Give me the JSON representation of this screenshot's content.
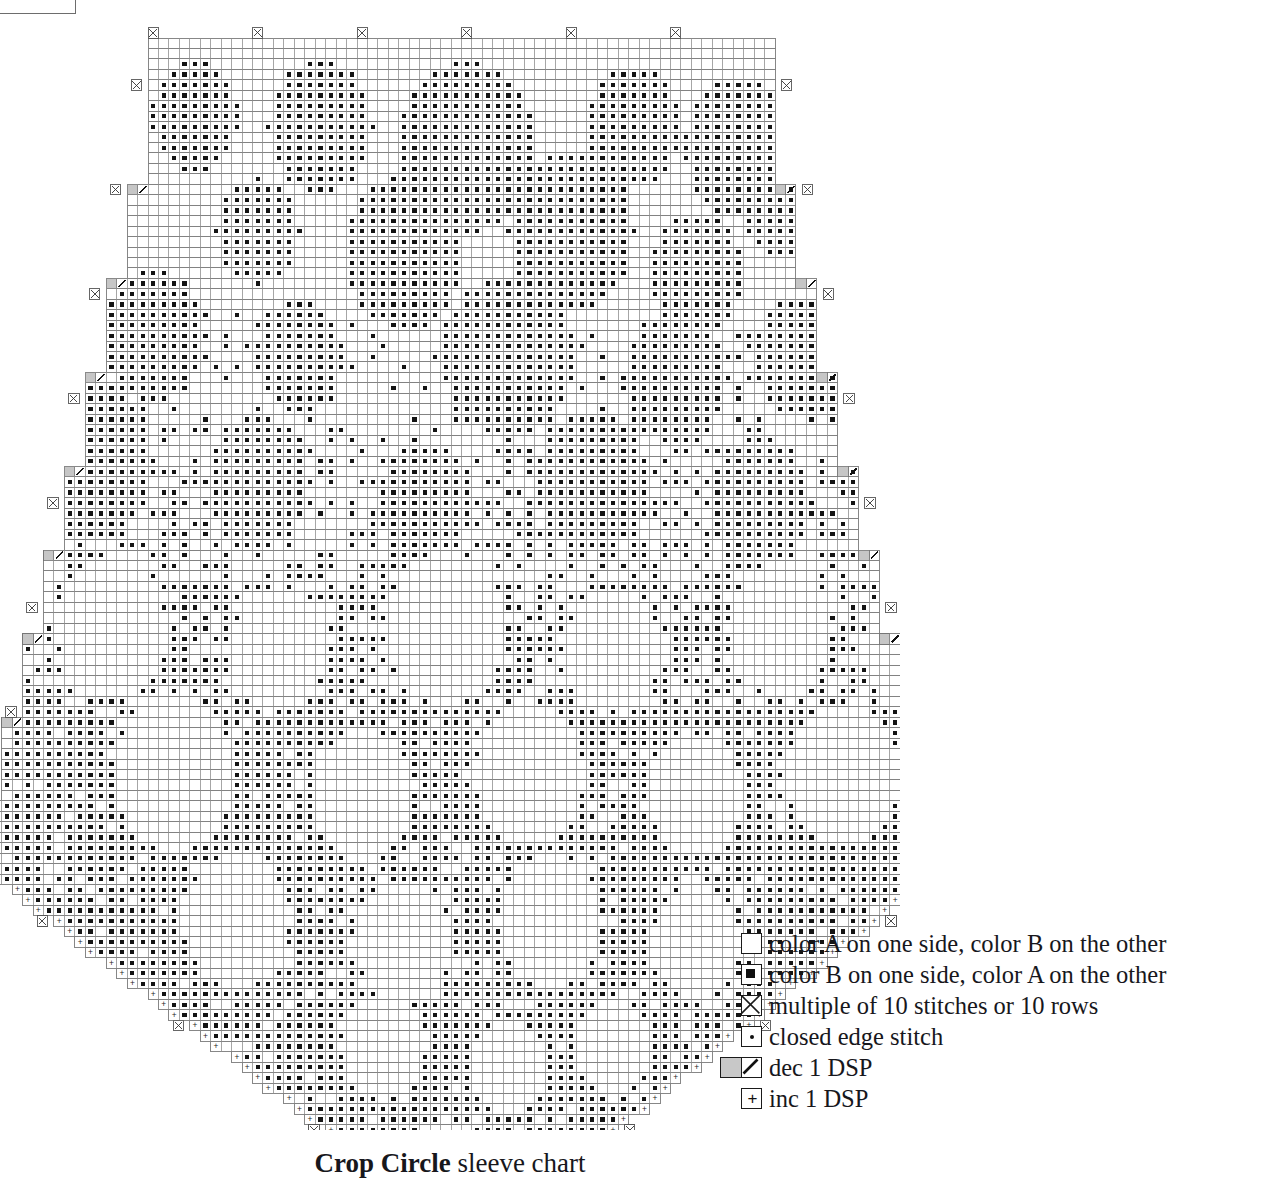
{
  "caption": {
    "name": "Crop Circle",
    "rest": " sleeve chart"
  },
  "artifact": {
    "text": "—y—"
  },
  "legend": {
    "title": "key",
    "items": [
      {
        "symbol": "empty-square",
        "label": "color A on one side, color B on the other"
      },
      {
        "symbol": "filled-square",
        "label": "color B on one side, color A on the other"
      },
      {
        "symbol": "crossed-square",
        "label": "multiple of 10 stitches or 10 rows"
      },
      {
        "symbol": "dotted-square",
        "label": "closed edge stitch"
      },
      {
        "symbol": "dec-pair",
        "label": "dec 1 DSP"
      },
      {
        "symbol": "plus-square",
        "label": "inc 1 DSP"
      }
    ]
  },
  "chart_data": {
    "type": "grid-chart",
    "title": "Crop Circle sleeve chart",
    "cell_px": 10.45,
    "origin": {
      "x": 148.0,
      "y": 38.0
    },
    "colors": {
      "grid_line": "#6f6f6f",
      "grid_line_minor": "#909090",
      "stitch_fill": "#141414",
      "dec_fill": "#c6c6c6",
      "background": "#ffffff",
      "marker_stroke": "#3a3a3a"
    },
    "legend_marker_interval": 10,
    "shape_note": "Sleeve outline: narrow at top (cap), widening by decrease steps to widest row, then tapering by increase steps to the cuff at bottom.",
    "outline_rows": [
      {
        "row": 0,
        "count": 14,
        "left": 0,
        "right": 60,
        "mark": "none"
      },
      {
        "row": 14,
        "count": 1,
        "left": -2,
        "right": 62,
        "mark": "dec"
      },
      {
        "row": 15,
        "count": 8,
        "left": -2,
        "right": 62,
        "mark": "none"
      },
      {
        "row": 23,
        "count": 1,
        "left": -4,
        "right": 64,
        "mark": "dec"
      },
      {
        "row": 24,
        "count": 8,
        "left": -4,
        "right": 64,
        "mark": "none"
      },
      {
        "row": 32,
        "count": 1,
        "left": -6,
        "right": 66,
        "mark": "dec"
      },
      {
        "row": 33,
        "count": 8,
        "left": -6,
        "right": 66,
        "mark": "none"
      },
      {
        "row": 41,
        "count": 1,
        "left": -8,
        "right": 68,
        "mark": "dec"
      },
      {
        "row": 42,
        "count": 7,
        "left": -8,
        "right": 68,
        "mark": "none"
      },
      {
        "row": 49,
        "count": 1,
        "left": -10,
        "right": 70,
        "mark": "dec"
      },
      {
        "row": 50,
        "count": 7,
        "left": -10,
        "right": 70,
        "mark": "none"
      },
      {
        "row": 57,
        "count": 1,
        "left": -12,
        "right": 72,
        "mark": "dec"
      },
      {
        "row": 58,
        "count": 7,
        "left": -12,
        "right": 72,
        "mark": "none"
      },
      {
        "row": 65,
        "count": 1,
        "left": -14,
        "right": 74,
        "mark": "dec"
      },
      {
        "row": 66,
        "count": 7,
        "left": -14,
        "right": 74,
        "mark": "none"
      },
      {
        "row": 73,
        "count": 1,
        "left": -16,
        "right": 76,
        "mark": "dec"
      },
      {
        "row": 74,
        "count": 5,
        "left": -16,
        "right": 76,
        "mark": "none"
      },
      {
        "row": 79,
        "count": 26,
        "left": -16,
        "right": 76,
        "mark": "inc-taper"
      },
      {
        "row": 105,
        "count": 1,
        "left": 18,
        "right": 44,
        "mark": "cuff"
      }
    ],
    "motif": "organic crop-circle roundels rendered as filled (color B) cells on an open (color A) ground",
    "stitch_counts": {
      "top_width": 60,
      "widest_width": 92,
      "bottom_width": 26
    }
  }
}
